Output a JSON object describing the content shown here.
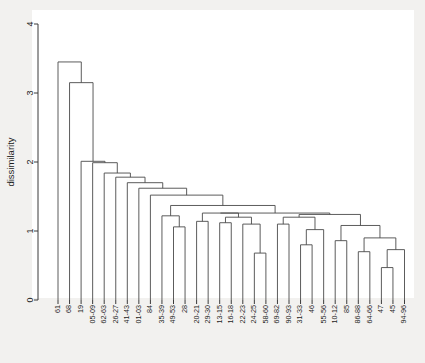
{
  "figure": {
    "background_color": "#f2f1ef",
    "panel_color": "#ffffff",
    "line_color": "#4a4a4a",
    "axis_color": "#3a3a3a"
  },
  "yaxis": {
    "label": "dissimilarity",
    "ticks": [
      "0",
      "1",
      "2",
      "3",
      "4"
    ],
    "tick_values": [
      0,
      1,
      2,
      3,
      4
    ],
    "limits": [
      0,
      4
    ]
  },
  "chart_data": {
    "type": "line",
    "title": "",
    "xlabel": "",
    "ylabel": "dissimilarity",
    "ylim": [
      0,
      4
    ],
    "grid": false,
    "legend": "none",
    "plot_kind": "dendrogram",
    "orientation": "vertical",
    "leaf_order": [
      "61",
      "68",
      "19",
      "05-09",
      "62-63",
      "26-27",
      "41-43",
      "01-03",
      "84",
      "35-39",
      "49-53",
      "28",
      "20-21",
      "29-30",
      "13-15",
      "16-18",
      "22-23",
      "24-25",
      "58-60",
      "69-82",
      "90-93",
      "31-33",
      "46",
      "55-56",
      "10-12",
      "85",
      "86-88",
      "64-66",
      "47",
      "45",
      "94-96"
    ],
    "leaf_count": 31,
    "merges": [
      {
        "id": "m1",
        "left": "24-25",
        "right": "58-60",
        "height": 0.68
      },
      {
        "id": "m2",
        "left": "47",
        "right": "45",
        "height": 0.47
      },
      {
        "id": "m3",
        "left": "m2",
        "right": "94-96",
        "height": 0.73
      },
      {
        "id": "m4",
        "left": "86-88",
        "right": "64-66",
        "height": 0.7
      },
      {
        "id": "m5",
        "left": "m4",
        "right": "m3",
        "height": 0.9
      },
      {
        "id": "m6",
        "left": "10-12",
        "right": "85",
        "height": 0.86
      },
      {
        "id": "m7",
        "left": "m6",
        "right": "m5",
        "height": 1.08
      },
      {
        "id": "m8",
        "left": "31-33",
        "right": "46",
        "height": 0.8
      },
      {
        "id": "m9",
        "left": "m8",
        "right": "55-56",
        "height": 1.02
      },
      {
        "id": "m10",
        "left": "69-82",
        "right": "90-93",
        "height": 1.1
      },
      {
        "id": "m11",
        "left": "m10",
        "right": "m9",
        "height": 1.2
      },
      {
        "id": "m12",
        "left": "m11",
        "right": "m7",
        "height": 1.24
      },
      {
        "id": "m13",
        "left": "22-23",
        "right": "m1",
        "height": 1.1
      },
      {
        "id": "m14",
        "left": "13-15",
        "right": "16-18",
        "height": 1.12
      },
      {
        "id": "m15",
        "left": "m14",
        "right": "m13",
        "height": 1.2
      },
      {
        "id": "m16",
        "left": "20-21",
        "right": "29-30",
        "height": 1.14
      },
      {
        "id": "m17",
        "left": "m16",
        "right": "m15",
        "height": 1.26
      },
      {
        "id": "m18",
        "left": "m17",
        "right": "m12",
        "height": 1.26
      },
      {
        "id": "m19",
        "left": "49-53",
        "right": "28",
        "height": 1.06
      },
      {
        "id": "m20",
        "left": "35-39",
        "right": "m19",
        "height": 1.22
      },
      {
        "id": "m21",
        "left": "m20",
        "right": "m18",
        "height": 1.37
      },
      {
        "id": "m22",
        "left": "84",
        "right": "m21",
        "height": 1.52
      },
      {
        "id": "m23",
        "left": "01-03",
        "right": "m22",
        "height": 1.62
      },
      {
        "id": "m24",
        "left": "41-43",
        "right": "m23",
        "height": 1.7
      },
      {
        "id": "m25",
        "left": "26-27",
        "right": "m24",
        "height": 1.78
      },
      {
        "id": "m26",
        "left": "62-63",
        "right": "m25",
        "height": 1.84
      },
      {
        "id": "m27",
        "left": "05-09",
        "right": "m26",
        "height": 1.99
      },
      {
        "id": "m28",
        "left": "19",
        "right": "m27",
        "height": 2.01
      },
      {
        "id": "m29",
        "left": "68",
        "right": "m28",
        "height": 3.15
      },
      {
        "id": "m30",
        "left": "61",
        "right": "m29",
        "height": 3.45
      }
    ]
  },
  "layout": {
    "plot_left": 44,
    "plot_right": 414,
    "plot_top": 12,
    "plot_bottom": 300,
    "y_zero_px": 300,
    "y_four_px": 24,
    "leaf_first_px": 58,
    "leaf_step_px": 11.55,
    "label_top_px": 305
  }
}
